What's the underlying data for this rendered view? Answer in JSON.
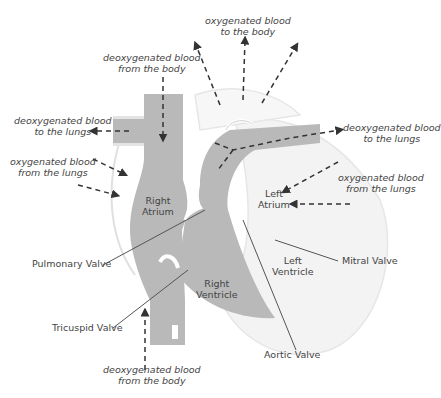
{
  "diagram": {
    "colors": {
      "vessel_gray": "#b9b9b9",
      "outline_light": "#ececec",
      "line": "#555555",
      "text": "#444444"
    },
    "flow_labels": {
      "oxy_to_body": [
        "oxygenated blood",
        "to the body"
      ],
      "deoxy_from_body_top": [
        "deoxygenated blood",
        "from the body"
      ],
      "deoxy_to_lungs_left": [
        "deoxygenated blood",
        "to the lungs"
      ],
      "oxy_from_lungs_left": [
        "oxygenated blood",
        "from the lungs"
      ],
      "deoxy_to_lungs_right": [
        "deoxygenated blood",
        "to the lungs"
      ],
      "oxy_from_lungs_right": [
        "oxygenated blood",
        "from the lungs"
      ],
      "deoxy_from_body_bottom": [
        "deoxygenated blood",
        "from the body"
      ]
    },
    "chambers": {
      "right_atrium": [
        "Right",
        "Atrium"
      ],
      "left_atrium": [
        "Left",
        "Atrium"
      ],
      "right_ventricle": [
        "Right",
        "Ventricle"
      ],
      "left_ventricle": [
        "Left",
        "Ventricle"
      ]
    },
    "valves": {
      "pulmonary": "Pulmonary Valve",
      "tricuspid": "Tricuspid Valve",
      "mitral": "Mitral Valve",
      "aortic": "Aortic Valve"
    }
  }
}
